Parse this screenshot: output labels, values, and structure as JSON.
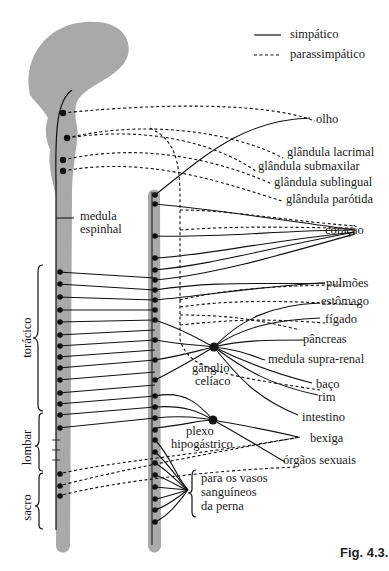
{
  "legend": {
    "sympathetic": "simpático",
    "parasympathetic": "parassimpático"
  },
  "labels": {
    "spinal_cord": [
      "medula",
      "espinhal"
    ],
    "thoracic": "torácico",
    "lumbar": "lombar",
    "sacral": "sacro",
    "celiac_ganglion": [
      "gânglio",
      "celíaco"
    ],
    "hypogastric_plexus": [
      "plexo",
      "hipogástrico"
    ],
    "leg_vessels": [
      "para os vasos",
      "sanguíneos",
      "da perna"
    ]
  },
  "organs": {
    "eye": "olho",
    "lacrimal": "glândula lacrimal",
    "submaxillary": "glândula submaxilar",
    "sublingual": "glândula sublingual",
    "parotid": "glândula parótida",
    "heart": "coração",
    "lungs": "pulmões",
    "stomach": "estômago",
    "liver": "fígado",
    "pancreas": "pâncreas",
    "adrenal": "medula supra-renal",
    "spleen": "baço",
    "kidney": "rim",
    "intestine": "intestino",
    "bladder": "bexiga",
    "sex_organs": "órgãos sexuais"
  },
  "caption": "Fig. 4.3."
}
